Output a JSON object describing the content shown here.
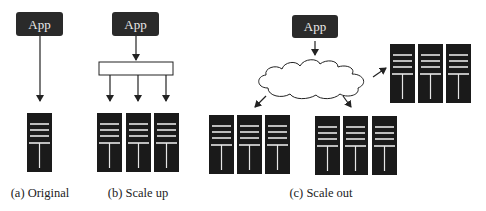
{
  "panels": [
    {
      "id": "a",
      "app_label": "App",
      "caption": "(a) Original",
      "server_count": 1
    },
    {
      "id": "b",
      "app_label": "App",
      "caption": "(b) Scale up",
      "server_count": 3
    },
    {
      "id": "c",
      "app_label": "App",
      "caption": "(c) Scale out",
      "server_groups": 3,
      "servers_per_group": 3,
      "network": "cloud"
    }
  ],
  "colors": {
    "app_box": "#2a2a2a",
    "server": "#1a1a1a",
    "server_lines": "#e6e6e6",
    "arrow": "#222222"
  }
}
